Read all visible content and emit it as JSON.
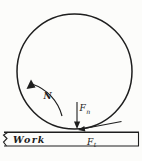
{
  "figure": {
    "colors": {
      "ink": "#1e1e1e",
      "background": "#fcfcfa"
    },
    "labels": {
      "work": "Work",
      "rotation_speed": "N",
      "normal_force": {
        "base": "F",
        "sub": "n"
      },
      "tangential_force": {
        "base": "F",
        "sub": "t"
      }
    }
  }
}
